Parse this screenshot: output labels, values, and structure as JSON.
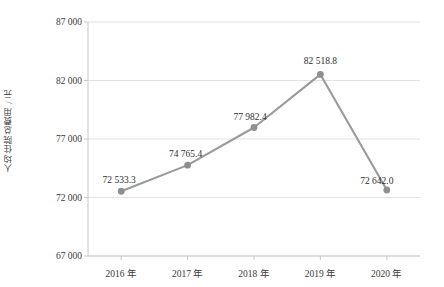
{
  "chart_data": {
    "type": "line",
    "title": "",
    "xlabel": "",
    "ylabel": "人均住院总费用 / 元",
    "categories": [
      "2016 年",
      "2017 年",
      "2018 年",
      "2019 年",
      "2020 年"
    ],
    "values": [
      72533.3,
      74765.4,
      77982.4,
      82518.8,
      72642.0
    ],
    "point_labels": [
      "72 533.3",
      "74 765.4",
      "77 982.4",
      "82 518.8",
      "72 642.0"
    ],
    "ylim": [
      67000,
      87000
    ],
    "y_ticks": [
      67000,
      72000,
      77000,
      82000,
      87000
    ],
    "y_tick_labels": [
      "67 000",
      "72 000",
      "77 000",
      "82 000",
      "87 000"
    ],
    "grid": true,
    "grid_axis": "y",
    "legend": "none",
    "series": [
      {
        "name": "人均住院总费用",
        "values": [
          72533.3,
          74765.4,
          77982.4,
          82518.8,
          72642.0
        ],
        "color": "#9a9a9a",
        "marker": "circle",
        "marker_color": "#8f8f8f"
      }
    ],
    "colors": {
      "line": "#9a9a9a",
      "marker": "#8f8f8f",
      "grid": "#e2e2e2",
      "axis": "#c9c9c9",
      "text": "#3a3a3a",
      "background": "#ffffff"
    }
  }
}
